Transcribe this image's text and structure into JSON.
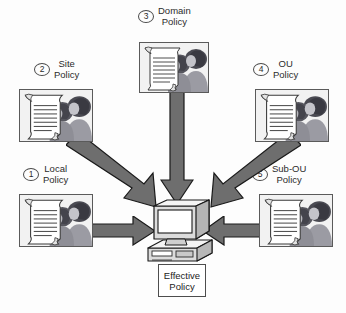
{
  "diagram": {
    "title_visible": false,
    "background_color": "#fdfdfd",
    "arrow_fill": "#6e6e6e",
    "arrow_stroke": "#1a1a1a",
    "box_fill": "#f2f2f2",
    "box_stroke": "#5a5a5a",
    "text_color": "#2b2b2b"
  },
  "nodes": [
    {
      "id": "local",
      "number": "1",
      "title_line1": "Local",
      "title_line2": "Policy",
      "icon": "policy-document-people-icon"
    },
    {
      "id": "site",
      "number": "2",
      "title_line1": "Site",
      "title_line2": "Policy",
      "icon": "policy-document-people-icon"
    },
    {
      "id": "domain",
      "number": "3",
      "title_line1": "Domain",
      "title_line2": "Policy",
      "icon": "policy-document-people-icon"
    },
    {
      "id": "ou",
      "number": "4",
      "title_line1": "OU",
      "title_line2": "Policy",
      "icon": "policy-document-people-icon"
    },
    {
      "id": "subou",
      "number": "5",
      "title_line1": "Sub-OU",
      "title_line2": "Policy",
      "icon": "policy-document-people-icon"
    }
  ],
  "target": {
    "icon": "desktop-computer-icon",
    "label_line1": "Effective",
    "label_line2": "Policy"
  },
  "arrows": [
    {
      "id": "local-to-computer",
      "direction": "right"
    },
    {
      "id": "site-to-computer",
      "direction": "down-right"
    },
    {
      "id": "domain-to-computer",
      "direction": "down"
    },
    {
      "id": "ou-to-computer",
      "direction": "down-left"
    },
    {
      "id": "subou-to-computer",
      "direction": "left"
    }
  ]
}
